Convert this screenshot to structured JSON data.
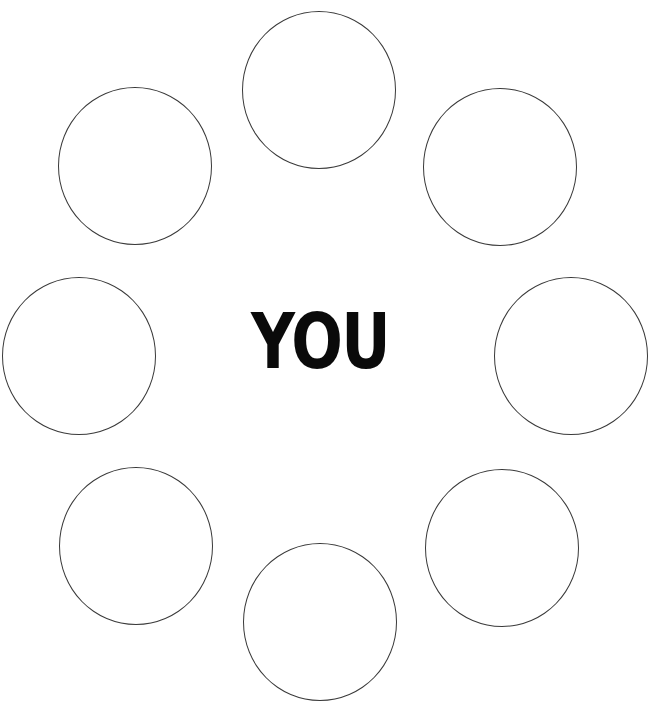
{
  "center": {
    "label": "YOU"
  },
  "colors": {
    "stroke": "#3a3a3a",
    "text": "#0a0a0a",
    "background": "#ffffff"
  },
  "circles": [
    {
      "position": "top",
      "label": ""
    },
    {
      "position": "top-right",
      "label": ""
    },
    {
      "position": "right",
      "label": ""
    },
    {
      "position": "bottom-right",
      "label": ""
    },
    {
      "position": "bottom",
      "label": ""
    },
    {
      "position": "bottom-left",
      "label": ""
    },
    {
      "position": "left",
      "label": ""
    },
    {
      "position": "top-left",
      "label": ""
    }
  ]
}
